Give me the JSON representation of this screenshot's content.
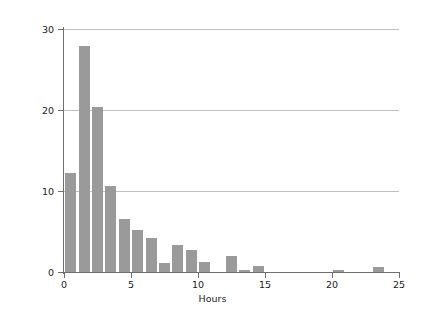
{
  "chart_data": {
    "type": "bar",
    "title": "",
    "subtitle": "",
    "xlabel": "Hours",
    "ylabel": "Percent",
    "xlim": [
      0,
      25
    ],
    "ylim": [
      0,
      30
    ],
    "xticks": [
      0,
      5,
      10,
      15,
      20,
      25
    ],
    "yticks": [
      0,
      10,
      20,
      30
    ],
    "xtick_labels": [
      "0",
      "5",
      "10",
      "15",
      "20",
      "25"
    ],
    "ytick_labels": [
      "0",
      "10",
      "20",
      "30"
    ],
    "grid": "horizontal",
    "legend": "none",
    "bar_color": "#9a9a9a",
    "bin_width": 1,
    "categories": [
      "0-1",
      "1-2",
      "2-3",
      "3-4",
      "4-5",
      "5-6",
      "6-7",
      "7-8",
      "8-9",
      "9-10",
      "10-11",
      "12-13",
      "13-14",
      "14-15",
      "20-21",
      "23-24"
    ],
    "bin_starts": [
      0,
      1,
      2,
      3,
      4,
      5,
      6,
      7,
      8,
      9,
      10,
      12,
      13,
      14,
      20,
      23
    ],
    "values": [
      12.2,
      27.9,
      20.4,
      10.6,
      6.6,
      5.2,
      4.2,
      1.1,
      3.3,
      2.7,
      1.2,
      2.0,
      0.3,
      0.7,
      0.2,
      0.6
    ]
  },
  "axis": {
    "x_title": "Hours",
    "y_title": "Percent"
  }
}
